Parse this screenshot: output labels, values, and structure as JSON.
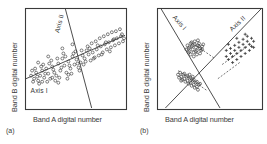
{
  "figure": {
    "background": "#ffffff",
    "ink": "#3a3a3a",
    "panels": [
      {
        "tag": "(a)",
        "x_axis_title": "Band A digital number",
        "y_axis_title": "Band B digital number",
        "axis_labels": [
          {
            "text": "Axis II",
            "role": "minor-axis-label"
          },
          {
            "text": "Axis I",
            "role": "major-axis-label"
          }
        ]
      },
      {
        "tag": "(b)",
        "x_axis_title": "Band A digital number",
        "y_axis_title": "Band B digital number",
        "axis_labels": [
          {
            "text": "Axis I",
            "role": "major-axis-label"
          },
          {
            "text": "Axis II",
            "role": "minor-axis-label"
          }
        ]
      }
    ]
  },
  "chart_data": [
    {
      "type": "scatter",
      "id": "panel-a",
      "title": "(a)",
      "xlabel": "Band A digital number",
      "ylabel": "Band B digital number",
      "xlim": [
        0,
        100
      ],
      "ylim": [
        0,
        100
      ],
      "grid": false,
      "legend": "none",
      "axis_ticks": "none",
      "marker": "open-circle",
      "annotations": [
        {
          "text": "Axis I",
          "kind": "line-label",
          "at": [
            14,
            16
          ]
        },
        {
          "text": "Axis II",
          "kind": "line-label",
          "at": [
            36,
            84
          ]
        }
      ],
      "overlay_lines": [
        {
          "name": "Axis I",
          "style": "solid",
          "from": [
            1,
            30
          ],
          "to": [
            99,
            73
          ]
        },
        {
          "name": "Axis II",
          "style": "solid",
          "from": [
            40,
            99
          ],
          "to": [
            66,
            1
          ]
        }
      ],
      "points": [
        [
          6,
          33
        ],
        [
          9,
          30
        ],
        [
          11,
          36
        ],
        [
          13,
          28
        ],
        [
          10,
          40
        ],
        [
          15,
          33
        ],
        [
          17,
          38
        ],
        [
          14,
          25
        ],
        [
          19,
          31
        ],
        [
          21,
          40
        ],
        [
          18,
          44
        ],
        [
          23,
          35
        ],
        [
          25,
          30
        ],
        [
          22,
          27
        ],
        [
          27,
          42
        ],
        [
          29,
          36
        ],
        [
          26,
          48
        ],
        [
          31,
          33
        ],
        [
          33,
          45
        ],
        [
          30,
          28
        ],
        [
          35,
          38
        ],
        [
          37,
          50
        ],
        [
          34,
          31
        ],
        [
          39,
          43
        ],
        [
          41,
          36
        ],
        [
          38,
          55
        ],
        [
          43,
          47
        ],
        [
          45,
          40
        ],
        [
          42,
          30
        ],
        [
          47,
          52
        ],
        [
          49,
          44
        ],
        [
          46,
          35
        ],
        [
          51,
          49
        ],
        [
          53,
          41
        ],
        [
          50,
          57
        ],
        [
          55,
          46
        ],
        [
          57,
          53
        ],
        [
          54,
          38
        ],
        [
          59,
          50
        ],
        [
          61,
          58
        ],
        [
          58,
          44
        ],
        [
          63,
          54
        ],
        [
          65,
          48
        ],
        [
          62,
          62
        ],
        [
          67,
          56
        ],
        [
          69,
          51
        ],
        [
          66,
          65
        ],
        [
          71,
          59
        ],
        [
          73,
          53
        ],
        [
          70,
          67
        ],
        [
          75,
          62
        ],
        [
          77,
          56
        ],
        [
          74,
          70
        ],
        [
          79,
          64
        ],
        [
          81,
          59
        ],
        [
          78,
          72
        ],
        [
          83,
          66
        ],
        [
          85,
          61
        ],
        [
          82,
          74
        ],
        [
          87,
          68
        ],
        [
          89,
          63
        ],
        [
          86,
          76
        ],
        [
          91,
          70
        ],
        [
          93,
          65
        ],
        [
          90,
          77
        ],
        [
          95,
          72
        ],
        [
          97,
          67
        ],
        [
          94,
          79
        ],
        [
          96,
          74
        ],
        [
          98,
          70
        ],
        [
          12,
          32
        ],
        [
          16,
          42
        ],
        [
          20,
          35
        ],
        [
          24,
          45
        ],
        [
          28,
          39
        ],
        [
          32,
          50
        ],
        [
          36,
          41
        ],
        [
          40,
          52
        ],
        [
          44,
          43
        ],
        [
          48,
          55
        ],
        [
          52,
          45
        ],
        [
          56,
          58
        ],
        [
          60,
          47
        ],
        [
          64,
          60
        ],
        [
          68,
          50
        ],
        [
          72,
          63
        ],
        [
          76,
          54
        ],
        [
          80,
          66
        ],
        [
          84,
          57
        ],
        [
          88,
          69
        ],
        [
          8,
          27
        ],
        [
          7,
          38
        ],
        [
          13,
          46
        ],
        [
          17,
          27
        ],
        [
          23,
          52
        ],
        [
          27,
          31
        ],
        [
          33,
          26
        ],
        [
          37,
          60
        ],
        [
          43,
          34
        ],
        [
          47,
          64
        ]
      ]
    },
    {
      "type": "scatter",
      "id": "panel-b",
      "title": "(b)",
      "xlabel": "Band A digital number",
      "ylabel": "Band B digital number",
      "xlim": [
        0,
        100
      ],
      "ylim": [
        0,
        100
      ],
      "grid": false,
      "legend": "none",
      "axis_ticks": "none",
      "annotations": [
        {
          "text": "Axis I",
          "kind": "line-label",
          "at": [
            20,
            84
          ]
        },
        {
          "text": "Axis II",
          "kind": "line-label",
          "at": [
            78,
            83
          ]
        }
      ],
      "overlay_lines": [
        {
          "name": "Axis I",
          "style": "solid",
          "from": [
            4,
            99
          ],
          "to": [
            60,
            1
          ]
        },
        {
          "name": "Axis II",
          "style": "solid",
          "from": [
            8,
            1
          ],
          "to": [
            99,
            99
          ]
        },
        {
          "name": "spread-1",
          "style": "dashed",
          "from": [
            33,
            66
          ],
          "to": [
            55,
            50
          ]
        },
        {
          "name": "spread-2",
          "style": "dashed",
          "from": [
            20,
            38
          ],
          "to": [
            48,
            18
          ]
        },
        {
          "name": "spread-3",
          "style": "dashed",
          "from": [
            62,
            44
          ],
          "to": [
            86,
            62
          ]
        },
        {
          "name": "spread-4",
          "style": "dashed",
          "from": [
            58,
            30
          ],
          "to": [
            80,
            47
          ]
        }
      ],
      "clusters": [
        {
          "name": "cluster-upper-left",
          "marker": "open-circle",
          "points": [
            [
              30,
              60
            ],
            [
              33,
              62
            ],
            [
              36,
              64
            ],
            [
              31,
              57
            ],
            [
              34,
              59
            ],
            [
              37,
              61
            ],
            [
              39,
              63
            ],
            [
              32,
              54
            ],
            [
              35,
              56
            ],
            [
              38,
              58
            ],
            [
              41,
              60
            ],
            [
              40,
              65
            ],
            [
              43,
              62
            ],
            [
              29,
              63
            ],
            [
              33,
              66
            ],
            [
              36,
              67
            ],
            [
              38,
              54
            ],
            [
              42,
              58
            ],
            [
              30,
              56
            ],
            [
              35,
              52
            ],
            [
              39,
              68
            ],
            [
              44,
              64
            ],
            [
              28,
              59
            ],
            [
              32,
              65
            ],
            [
              41,
              55
            ],
            [
              37,
              57
            ],
            [
              34,
              63
            ],
            [
              31,
              61
            ],
            [
              43,
              59
            ],
            [
              40,
              62
            ]
          ]
        },
        {
          "name": "cluster-lower-left",
          "marker": "open-circle",
          "points": [
            [
              20,
              34
            ],
            [
              23,
              32
            ],
            [
              26,
              30
            ],
            [
              29,
              28
            ],
            [
              32,
              26
            ],
            [
              35,
              24
            ],
            [
              38,
              22
            ],
            [
              22,
              36
            ],
            [
              25,
              34
            ],
            [
              28,
              32
            ],
            [
              31,
              30
            ],
            [
              34,
              28
            ],
            [
              37,
              26
            ],
            [
              40,
              24
            ],
            [
              21,
              31
            ],
            [
              24,
              29
            ],
            [
              27,
              27
            ],
            [
              30,
              25
            ],
            [
              33,
              23
            ],
            [
              36,
              21
            ],
            [
              39,
              19
            ],
            [
              26,
              35
            ],
            [
              29,
              33
            ],
            [
              32,
              31
            ],
            [
              35,
              29
            ],
            [
              38,
              27
            ],
            [
              41,
              25
            ],
            [
              23,
              28
            ],
            [
              31,
              34
            ],
            [
              34,
              32
            ]
          ]
        },
        {
          "name": "cluster-right",
          "marker": "plus",
          "points": [
            [
              66,
              52
            ],
            [
              70,
              55
            ],
            [
              74,
              58
            ],
            [
              78,
              61
            ],
            [
              82,
              64
            ],
            [
              86,
              67
            ],
            [
              90,
              70
            ],
            [
              68,
              49
            ],
            [
              72,
              52
            ],
            [
              76,
              55
            ],
            [
              80,
              58
            ],
            [
              84,
              61
            ],
            [
              88,
              64
            ],
            [
              92,
              67
            ],
            [
              70,
              60
            ],
            [
              74,
              63
            ],
            [
              78,
              66
            ],
            [
              82,
              69
            ],
            [
              86,
              72
            ],
            [
              66,
              58
            ],
            [
              90,
              62
            ],
            [
              72,
              46
            ],
            [
              76,
              49
            ],
            [
              80,
              52
            ],
            [
              84,
              55
            ],
            [
              88,
              58
            ],
            [
              92,
              61
            ],
            [
              68,
              64
            ],
            [
              76,
              70
            ],
            [
              84,
              74
            ]
          ]
        }
      ]
    }
  ]
}
